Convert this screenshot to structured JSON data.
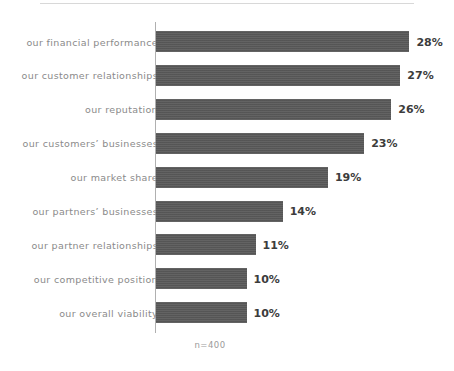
{
  "chart_data": {
    "type": "bar",
    "orientation": "horizontal",
    "title": "",
    "xlabel": "",
    "ylabel": "",
    "categories": [
      "our financial performance",
      "our customer relationships",
      "our reputation",
      "our customers’ businesses",
      "our market share",
      "our partners’ businesses",
      "our partner relationships",
      "our competitive position",
      "our overall viability"
    ],
    "values": [
      28,
      27,
      26,
      23,
      19,
      14,
      11,
      10,
      10
    ],
    "value_labels": [
      "28%",
      "27%",
      "26%",
      "23%",
      "19%",
      "14%",
      "11%",
      "10%",
      "10%"
    ],
    "unit": "%",
    "xlim": [
      0,
      28
    ],
    "grid": false,
    "legend": false,
    "annotations": [
      "n=400"
    ],
    "bar_color": "#5a5a5a",
    "label_color": "#8a8a8a",
    "value_color": "#3c3c3c",
    "axis_color": "#b0b0b0",
    "background_color": "#ffffff"
  },
  "footnote": {
    "sample_size": "n=400"
  }
}
